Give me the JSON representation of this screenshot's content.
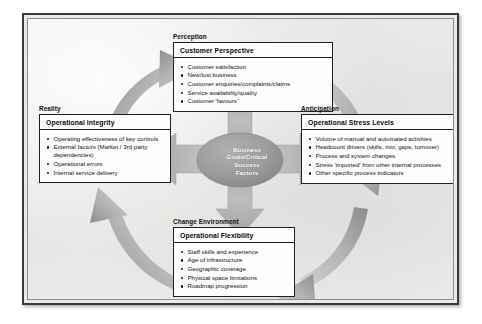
{
  "diagram": {
    "centre": {
      "label": "Business\nGoals/Critical\nSuccess\nFactors",
      "fill": "#9a9a98"
    },
    "quadrants": [
      {
        "category": "Perception",
        "title": "Customer Perspective",
        "items": [
          "Customer satisfaction",
          "New/lost business",
          "Customer enquiries/complaints/claims",
          "Service availability/quality",
          "Customer 'favours'"
        ]
      },
      {
        "category": "Reality",
        "title": "Operational Integrity",
        "items": [
          "Operating effectiveness of key controls",
          "External factors (Market / 3rd party dependencies)",
          "Operational errors",
          "Internal service delivery"
        ]
      },
      {
        "category": "Anticipation",
        "title": "Operational Stress Levels",
        "items": [
          "Volume of manual and automated activities",
          "Headcount drivers (skills, mix, gaps, turnover)",
          "Process and system changes",
          "Stress 'imported' from other internal processes",
          "Other specific process indicators"
        ]
      },
      {
        "category": "Change Environment",
        "title": "Operational Flexibility",
        "items": [
          "Staff skills and experience",
          "Age of infrastructure",
          "Geographic coverage",
          "Physical space limitations",
          "Roadmap progression"
        ]
      }
    ],
    "cycle_arrows": [
      {
        "name": "reality-to-perception",
        "direction": "clockwise"
      },
      {
        "name": "perception-to-anticipation",
        "direction": "clockwise"
      },
      {
        "name": "anticipation-to-change-environment",
        "direction": "clockwise"
      },
      {
        "name": "change-environment-to-reality",
        "direction": "clockwise"
      }
    ],
    "radial_arrows": [
      {
        "name": "centre-arrow-up",
        "points_to": "Perception"
      },
      {
        "name": "centre-arrow-left",
        "points_to": "Reality"
      },
      {
        "name": "centre-arrow-right",
        "points_to": "Anticipation"
      },
      {
        "name": "centre-arrow-down",
        "points_to": "Change Environment"
      }
    ],
    "colors": {
      "arrow_light": "#c6c6c4",
      "arrow_dark": "#8e8e8c",
      "frame_border": "#3a3a3a",
      "paper": "#ececeb",
      "box_fill": "#fdfdfd"
    }
  }
}
